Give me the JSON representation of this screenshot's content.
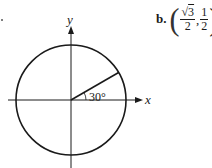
{
  "figure": {
    "part_marker": ".",
    "axes": {
      "x_label": "x",
      "y_label": "y"
    },
    "angle_label": "30°",
    "angle_degrees": 30,
    "circle": {
      "type": "unit-circle"
    }
  },
  "answer": {
    "part": "b.",
    "open_paren": "(",
    "x_num_root": "3",
    "x_num_prefix": "√",
    "x_den": "2",
    "comma": ",",
    "y_num": "1",
    "y_den": "2",
    "close_paren": ")"
  },
  "colors": {
    "stroke": "#1a1a1a",
    "background": "#ffffff"
  }
}
